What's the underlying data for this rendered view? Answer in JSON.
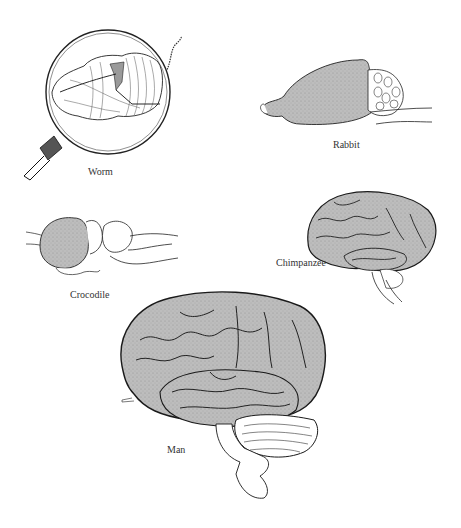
{
  "figure": {
    "colors": {
      "background": "#ffffff",
      "cortex_fill": "#b8b8b8",
      "outline": "#1a1a1a",
      "label_text": "#333333"
    },
    "specimens": [
      {
        "id": "worm",
        "label": "Worm",
        "shown_in": "magnifying glass"
      },
      {
        "id": "rabbit",
        "label": "Rabbit"
      },
      {
        "id": "crocodile",
        "label": "Crocodile"
      },
      {
        "id": "chimpanzee",
        "label": "Chimpanzee"
      },
      {
        "id": "man",
        "label": "Man"
      }
    ]
  }
}
